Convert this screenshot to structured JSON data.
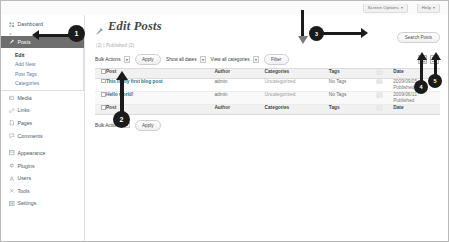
{
  "adminbar": {
    "tabs": [
      {
        "label": "Screen Options",
        "icon": "chevron-down-icon"
      },
      {
        "label": "Help",
        "icon": "chevron-down-icon"
      }
    ]
  },
  "sidebar": {
    "collapse_label": "◂",
    "items": [
      {
        "label": "Dashboard",
        "icon": "dashboard-icon",
        "active": false
      },
      {
        "label": "Posts",
        "icon": "pin-icon",
        "active": true
      },
      {
        "label": "Media",
        "icon": "media-icon",
        "active": false
      },
      {
        "label": "Links",
        "icon": "link-icon",
        "active": false
      },
      {
        "label": "Pages",
        "icon": "page-icon",
        "active": false
      },
      {
        "label": "Comments",
        "icon": "comment-icon",
        "active": false
      },
      {
        "label": "Appearance",
        "icon": "appearance-icon",
        "active": false
      },
      {
        "label": "Plugins",
        "icon": "plugin-icon",
        "active": false
      },
      {
        "label": "Users",
        "icon": "users-icon",
        "active": false
      },
      {
        "label": "Tools",
        "icon": "tools-icon",
        "active": false
      },
      {
        "label": "Settings",
        "icon": "settings-icon",
        "active": false
      }
    ],
    "submenu": [
      {
        "label": "Edit",
        "current": true
      },
      {
        "label": "Add New",
        "current": false
      },
      {
        "label": "Post Tags",
        "current": false
      },
      {
        "label": "Categories",
        "current": false
      }
    ]
  },
  "page": {
    "title": "Edit Posts",
    "title_icon": "pin-icon",
    "status_links": "(2)  |  Published (2)",
    "search_button": "Search Posts"
  },
  "tablenav": {
    "bulk_actions_label": "Bulk Actions",
    "apply_label": "Apply",
    "dates_label": "Show all dates",
    "categories_label": "View all categories",
    "filter_label": "Filter",
    "view_list_icon": "list-view-icon",
    "view_excerpt_icon": "excerpt-view-icon"
  },
  "table": {
    "columns": [
      "Post",
      "Author",
      "Categories",
      "Tags",
      "comments-icon",
      "Date"
    ],
    "rows": [
      {
        "title": "This is my first blog post",
        "author": "admin",
        "categories": "Uncategorized",
        "tags": "No Tags",
        "comments": "0",
        "date": "2009/09/05",
        "status": "Published"
      },
      {
        "title": "Hello world!",
        "author": "admin",
        "categories": "Uncategorized",
        "tags": "No Tags",
        "comments": "0",
        "date": "2009/06/11",
        "status": "Published"
      }
    ]
  },
  "bottomnav": {
    "bulk_actions_label": "Bulk Actions",
    "apply_label": "Apply"
  },
  "annotations": [
    {
      "number": "1",
      "target": "posts-menu-item"
    },
    {
      "number": "2",
      "target": "post-title-link"
    },
    {
      "number": "3",
      "target": "filter-bar"
    },
    {
      "number": "4",
      "target": "list-view-toggle"
    },
    {
      "number": "5",
      "target": "excerpt-view-toggle"
    }
  ]
}
